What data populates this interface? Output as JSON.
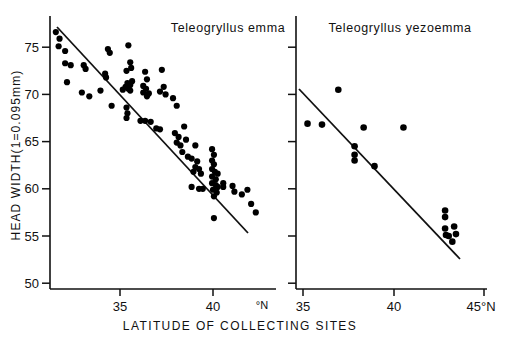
{
  "figure": {
    "background": "#ffffff",
    "ink": "#000000",
    "xlabel": "LATITUDE OF COLLECTING SITES",
    "ylabel": "HEAD WIDTH(1=0.095mm)"
  },
  "chart_data": [
    {
      "type": "scatter",
      "panel": "left",
      "title": "Teleogryllus emma",
      "xlabel": "LATITUDE OF COLLECTING SITES",
      "ylabel": "HEAD WIDTH(1=0.095mm)",
      "xlim": [
        31.0,
        42.6
      ],
      "ylim": [
        50,
        78.2
      ],
      "xticks": [
        35,
        40
      ],
      "xtick_labels": [
        "35",
        "40"
      ],
      "x_unit_label": "°N",
      "yticks": [
        50,
        55,
        60,
        65,
        70,
        75
      ],
      "ytick_labels": [
        "50",
        "55",
        "60",
        "65",
        "70",
        "75"
      ],
      "grid": false,
      "legend": "none",
      "trendline": {
        "x0": 31.4,
        "y0": 77.4,
        "x1": 41.6,
        "y1": 56.8
      },
      "points": [
        [
          31.55,
          76.6
        ],
        [
          31.75,
          75.9
        ],
        [
          31.7,
          75.1
        ],
        [
          32.05,
          74.6
        ],
        [
          32.05,
          73.3
        ],
        [
          32.35,
          73.1
        ],
        [
          32.15,
          71.3
        ],
        [
          33.05,
          73.1
        ],
        [
          33.15,
          72.7
        ],
        [
          33.35,
          69.8
        ],
        [
          32.95,
          70.2
        ],
        [
          33.95,
          70.4
        ],
        [
          34.35,
          74.8
        ],
        [
          34.45,
          74.4
        ],
        [
          34.2,
          72.2
        ],
        [
          34.25,
          71.8
        ],
        [
          34.55,
          68.8
        ],
        [
          35.45,
          75.2
        ],
        [
          35.55,
          73.4
        ],
        [
          35.35,
          72.5
        ],
        [
          35.6,
          72.8
        ],
        [
          35.65,
          71.4
        ],
        [
          35.4,
          71.2
        ],
        [
          35.55,
          71.0
        ],
        [
          35.3,
          70.8
        ],
        [
          35.45,
          70.6
        ],
        [
          35.55,
          70.4
        ],
        [
          35.15,
          70.5
        ],
        [
          35.35,
          68.6
        ],
        [
          35.4,
          68.0
        ],
        [
          35.35,
          67.5
        ],
        [
          36.35,
          72.4
        ],
        [
          36.45,
          71.6
        ],
        [
          36.25,
          70.9
        ],
        [
          36.4,
          70.6
        ],
        [
          36.25,
          70.2
        ],
        [
          36.55,
          70.1
        ],
        [
          36.45,
          69.8
        ],
        [
          36.1,
          67.2
        ],
        [
          36.35,
          67.2
        ],
        [
          36.65,
          67.1
        ],
        [
          37.25,
          72.6
        ],
        [
          37.35,
          70.8
        ],
        [
          37.15,
          70.3
        ],
        [
          37.45,
          70.0
        ],
        [
          36.95,
          66.4
        ],
        [
          37.15,
          66.3
        ],
        [
          37.85,
          69.6
        ],
        [
          38.05,
          68.8
        ],
        [
          37.95,
          65.9
        ],
        [
          38.15,
          65.5
        ],
        [
          38.05,
          64.9
        ],
        [
          38.25,
          64.6
        ],
        [
          38.45,
          66.6
        ],
        [
          38.55,
          65.2
        ],
        [
          38.35,
          63.9
        ],
        [
          38.65,
          63.4
        ],
        [
          38.85,
          63.2
        ],
        [
          39.05,
          64.6
        ],
        [
          39.15,
          62.9
        ],
        [
          39.05,
          62.3
        ],
        [
          39.25,
          62.1
        ],
        [
          38.95,
          61.8
        ],
        [
          39.35,
          61.6
        ],
        [
          38.85,
          60.2
        ],
        [
          39.25,
          60.0
        ],
        [
          39.45,
          60.0
        ],
        [
          39.95,
          64.2
        ],
        [
          40.05,
          63.6
        ],
        [
          39.95,
          63.0
        ],
        [
          40.05,
          62.6
        ],
        [
          39.95,
          62.1
        ],
        [
          40.1,
          61.8
        ],
        [
          39.95,
          61.3
        ],
        [
          40.15,
          61.0
        ],
        [
          39.95,
          60.6
        ],
        [
          40.15,
          60.4
        ],
        [
          40.25,
          60.2
        ],
        [
          40.0,
          59.9
        ],
        [
          40.2,
          59.6
        ],
        [
          40.05,
          59.2
        ],
        [
          40.25,
          61.6
        ],
        [
          40.55,
          60.6
        ],
        [
          40.55,
          60.2
        ],
        [
          41.05,
          60.3
        ],
        [
          41.15,
          59.7
        ],
        [
          40.05,
          56.9
        ],
        [
          41.55,
          59.4
        ],
        [
          41.85,
          59.9
        ],
        [
          42.05,
          58.4
        ],
        [
          42.3,
          57.5
        ]
      ]
    },
    {
      "type": "scatter",
      "panel": "right",
      "title": "Teleogryllus yezoemma",
      "xlabel": "LATITUDE OF COLLECTING SITES",
      "ylabel": "HEAD WIDTH(1=0.095mm)",
      "xlim": [
        34.55,
        45.9
      ],
      "ylim": [
        50,
        78.2
      ],
      "xticks": [
        35,
        40,
        45
      ],
      "xtick_labels": [
        "35",
        "40",
        "45°N"
      ],
      "yticks": [
        50,
        55,
        60,
        65,
        70,
        75
      ],
      "ytick_labels": [
        "",
        "",
        "",
        "",
        "",
        ""
      ],
      "grid": false,
      "legend": "none",
      "trendline": {
        "x0": 35.15,
        "y0": 71.2,
        "x1": 44.05,
        "y1": 53.1
      },
      "points": [
        [
          35.25,
          66.9
        ],
        [
          36.05,
          66.8
        ],
        [
          36.95,
          70.5
        ],
        [
          38.35,
          66.5
        ],
        [
          37.85,
          64.5
        ],
        [
          37.85,
          63.6
        ],
        [
          37.85,
          63.0
        ],
        [
          38.95,
          62.4
        ],
        [
          40.55,
          66.5
        ],
        [
          42.85,
          57.7
        ],
        [
          42.85,
          57.0
        ],
        [
          42.85,
          55.8
        ],
        [
          43.35,
          56.0
        ],
        [
          42.9,
          55.1
        ],
        [
          43.05,
          55.0
        ],
        [
          43.45,
          55.2
        ],
        [
          43.25,
          54.4
        ]
      ]
    }
  ],
  "ticklabels": {
    "y": [
      "75",
      "70",
      "65",
      "60",
      "55",
      "50"
    ],
    "left_x": [
      "35",
      "40"
    ],
    "left_x_unit": "°N",
    "right_x": [
      "35",
      "40",
      "45°N"
    ]
  }
}
